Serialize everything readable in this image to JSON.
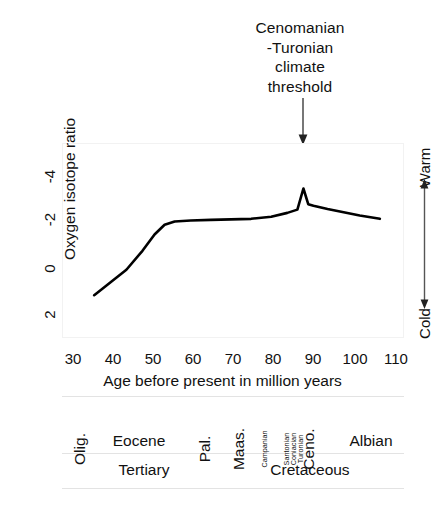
{
  "chart_data": {
    "type": "line",
    "title": "Cenomanian\n-Turonian\nclimate\nthreshold",
    "xlabel": "Age before present in million years",
    "ylabel": "Oxygen isotope ratio",
    "xlim": [
      28,
      113
    ],
    "ylim": [
      2.6,
      -4.6
    ],
    "y_inverted": true,
    "grid": false,
    "legend": "none",
    "xticks": [
      "30",
      "40",
      "50",
      "60",
      "70",
      "80",
      "90",
      "100",
      "110"
    ],
    "xtick_values": [
      30,
      40,
      50,
      60,
      70,
      80,
      90,
      100,
      110
    ],
    "yticks": [
      "-4",
      "-2",
      "0",
      "2"
    ],
    "ytick_values": [
      -4,
      -2,
      0,
      2
    ],
    "series": [
      {
        "name": "Oxygen isotope ratio",
        "color": "#000000",
        "x": [
          36.0,
          40.0,
          44.0,
          48.0,
          51.0,
          53.5,
          56.0,
          60.0,
          65.0,
          70.0,
          75.0,
          80.0,
          84.0,
          86.5,
          88.0,
          89.2,
          90.5,
          94.0,
          98.0,
          102.0,
          107.0
        ],
        "y": [
          1.02,
          0.55,
          0.08,
          -0.62,
          -1.22,
          -1.58,
          -1.7,
          -1.74,
          -1.76,
          -1.78,
          -1.8,
          -1.88,
          -2.02,
          -2.14,
          -2.92,
          -2.34,
          -2.28,
          -2.16,
          -2.04,
          -1.92,
          -1.8
        ]
      }
    ],
    "annotations": [
      {
        "name": "cenomanian-turonian-threshold",
        "text": "Cenomanian\n-Turonian\nclimate\nthreshold",
        "points_to_x": 88,
        "arrow": "down"
      },
      {
        "name": "temperature-direction",
        "top_label": "Warm",
        "bottom_label": "Cold",
        "arrow": "double-vertical"
      }
    ]
  },
  "annotation": {
    "title": "Cenomanian\n-Turonian\nclimate\nthreshold"
  },
  "axes": {
    "y_title": "Oxygen isotope ratio",
    "x_title": "Age before present in million years",
    "y_ticks": [
      {
        "label": "-4"
      },
      {
        "label": "-2"
      },
      {
        "label": "0"
      },
      {
        "label": "2"
      }
    ],
    "x_ticks": [
      {
        "label": "30"
      },
      {
        "label": "40"
      },
      {
        "label": "50"
      },
      {
        "label": "60"
      },
      {
        "label": "70"
      },
      {
        "label": "80"
      },
      {
        "label": "90"
      },
      {
        "label": "100"
      },
      {
        "label": "110"
      }
    ]
  },
  "temperature_scale": {
    "warm_label": "Warm",
    "cold_label": "Cold"
  },
  "stratigraphy": {
    "stages": [
      {
        "label": "Olig.",
        "style": "vertical"
      },
      {
        "label": "Eocene",
        "style": "horizontal"
      },
      {
        "label": "Pal.",
        "style": "vertical"
      },
      {
        "label": "Maas.",
        "style": "vertical"
      },
      {
        "label": "Campanian",
        "style": "tiny"
      },
      {
        "label": "Santonian",
        "style": "tiny"
      },
      {
        "label": "Coniacian",
        "style": "tiny"
      },
      {
        "label": "Turonian",
        "style": "tiny"
      },
      {
        "label": "Ceno.",
        "style": "vertical"
      },
      {
        "label": "Albian",
        "style": "horizontal"
      }
    ],
    "periods": [
      {
        "label": "Tertiary"
      },
      {
        "label": "Cretaceous"
      }
    ]
  }
}
